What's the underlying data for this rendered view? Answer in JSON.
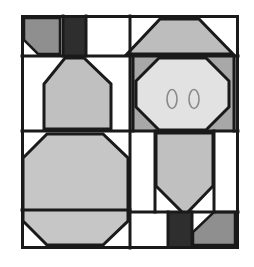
{
  "image": {
    "title": "Abstract Geometric Quilt Block Face Pattern",
    "width": 254,
    "height": 267,
    "background_color": "#ffffff",
    "alt_text": "Black-outlined geometric quilt block divided into four quadrants forming a stylized animal face with two small eye ellipses"
  },
  "palette": {
    "background": "#ffffff",
    "outline": "#1a1a1a",
    "very_dark_gray": "#2e2e2e",
    "dark_gray": "#8f8f8f",
    "medium_gray": "#bdbdbd",
    "light_gray": "#d2d2d2",
    "lightest_gray": "#e2e2e2",
    "white_patch": "#ffffff"
  },
  "frame": {
    "name": "outer-frame",
    "x": 21,
    "y": 15,
    "width": 217,
    "height": 233,
    "stroke_width": 3,
    "fill": "#ffffff"
  },
  "grid": {
    "vertical_divider_x": 130,
    "horizontal_divider_y": 131,
    "top_band_y": 57,
    "mid_band_y": 131,
    "lower_band_y": 209
  },
  "quadrants": [
    {
      "id": "top-left",
      "name": "top-left-quadrant",
      "description": "Dark angled wedge with white corner notch and a very dark vertical bar"
    },
    {
      "id": "top-right",
      "name": "top-right-quadrant",
      "description": "Trapezoid hat shape above an octagonal face panel containing two eyes"
    },
    {
      "id": "bottom-left",
      "name": "bottom-left-quadrant",
      "description": "Large light gray octagon filling the quadrant"
    },
    {
      "id": "bottom-right",
      "name": "bottom-right-quadrant",
      "description": "Downward pointing pentagon snout with dark bar and angled gray corner wedge"
    }
  ],
  "shapes": {
    "tl_wedge": {
      "name": "top-left-dark-wedge",
      "points": "24,18 62,18 62,54 37,54 24,41",
      "fill": "#8f8f8f"
    },
    "tl_corner_notch": {
      "name": "top-left-white-notch",
      "points": "24,41 37,54 24,54",
      "fill": "#ffffff"
    },
    "tl_dark_bar": {
      "name": "top-left-dark-vertical-bar",
      "points": "65,18 85,18 85,54 65,54",
      "fill": "#2e2e2e"
    },
    "tl_white_panel": {
      "name": "top-left-white-panel",
      "points": "88,18 127,18 127,54 88,54",
      "fill": "#ffffff"
    },
    "ml_trapezoid": {
      "name": "mid-left-trapezoid",
      "points": "65,57 85,57 110,82 110,128 45,128 45,82 65,57",
      "fill": "#c0c0c0"
    },
    "ml_left_white": {
      "name": "mid-left-white-strip",
      "points": "24,57 62,57 42,82 42,128 24,128",
      "fill": "#ffffff"
    },
    "ml_right_white": {
      "name": "mid-right-white-strip",
      "points": "88,57 127,57 127,128 113,128 113,82",
      "fill": "#ffffff"
    },
    "bl_octagon": {
      "name": "bottom-left-octagon",
      "points": "47,133 104,133 127,156 127,222 104,245 47,245 24,222 24,156",
      "fill": "#c6c6c6"
    },
    "tr_hat": {
      "name": "top-right-trapezoid-hat",
      "points": "158,20 200,20 232,53 128,53",
      "fill": "#bdbdbd"
    },
    "tr_left_white": {
      "name": "top-right-left-white-triangle",
      "points": "133,20 158,20 133,49",
      "fill": "#ffffff"
    },
    "tr_right_white": {
      "name": "top-right-right-white-triangle",
      "points": "200,20 234,20 234,52",
      "fill": "#ffffff"
    },
    "face_backing": {
      "name": "face-backing-panel",
      "points": "133,57 234,57 234,128 133,128",
      "fill": "#a8a8a8"
    },
    "face_octagon": {
      "name": "face-octagon",
      "points": "158,59 207,59 228,80 228,108 207,128 158,128 139,108 139,80",
      "fill": "#e2e2e2"
    },
    "eye_left": {
      "name": "left-eye",
      "cx": 172,
      "cy": 98,
      "rx": 5,
      "ry": 9,
      "fill": "none",
      "stroke": "#8a8a8a"
    },
    "eye_right": {
      "name": "right-eye",
      "cx": 194,
      "cy": 98,
      "rx": 5,
      "ry": 9,
      "fill": "none",
      "stroke": "#8a8a8a"
    },
    "br_snout": {
      "name": "bottom-right-snout-pentagon",
      "points": "155,135 213,135 213,186 184,215 155,186",
      "fill": "#c0c0c0"
    },
    "br_left_white": {
      "name": "bottom-right-left-white-region",
      "points": "133,135 152,135 152,186 181,215 133,215",
      "fill": "#ffffff"
    },
    "br_right_white": {
      "name": "bottom-right-right-white-region",
      "points": "216,135 234,135 234,211 187,211 216,184",
      "fill": "#ffffff"
    },
    "br_dark_bar": {
      "name": "bottom-dark-vertical-bar",
      "points": "170,213 190,213 190,245 170,245",
      "fill": "#2e2e2e"
    },
    "br_corner_wedge": {
      "name": "bottom-right-gray-wedge",
      "points": "193,213 234,213 234,245 193,245 193,232",
      "fill": "#8f8f8f"
    },
    "br_bottom_white": {
      "name": "bottom-right-bottom-white-patch",
      "points": "133,218 167,218 167,245 133,245",
      "fill": "#ffffff"
    }
  },
  "lines": {
    "name": "divider-lines",
    "segments": [
      "21,15 238,15 238,248 21,248 21,15",
      "21,56 238,56",
      "21,131 238,131",
      "130,15 130,248",
      "21,210 130,210",
      "130,212 238,212",
      "62,15 62,56",
      "86,15 86,56",
      "130,57 130,131",
      "156,131 156,212",
      "214,131 214,212",
      "168,212 168,248",
      "191,212 191,248"
    ]
  }
}
